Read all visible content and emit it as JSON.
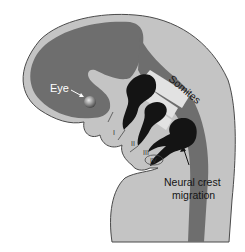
{
  "figure": {
    "labels": {
      "eye": "Eye",
      "somites": "Somites",
      "neural_crest_line1": "Neural crest",
      "neural_crest_line2": "migration",
      "arch1": "I",
      "arch2": "II",
      "arch3": "III",
      "arch4": "IV"
    },
    "colors": {
      "background": "#ffffff",
      "tissue_light": "#c4c4c4",
      "tissue_dark": "#6e6e6e",
      "neural_crest": "#141414",
      "somite_light": "#e2e2e2",
      "outline": "#4a4a4a",
      "eye_label": "#ffffff"
    }
  }
}
